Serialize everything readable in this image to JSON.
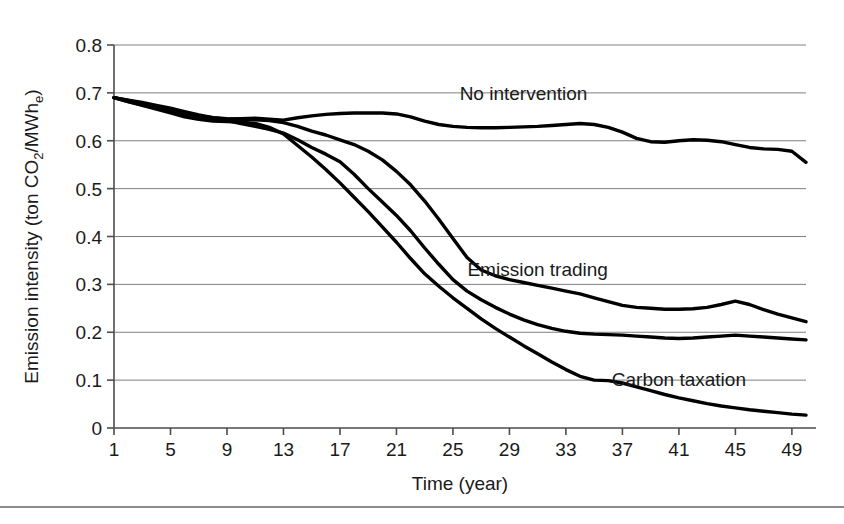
{
  "chart_data": {
    "type": "line",
    "title": "",
    "xlabel": "Time (year)",
    "ylabel": "Emission intensity (ton CO2/MWhe)",
    "ylabel_parts": {
      "prefix": "Emission intensity (ton CO",
      "sub1": "2",
      "middle": "/MWh",
      "sub2": "e",
      "suffix": ")"
    },
    "xlim": [
      1,
      50
    ],
    "ylim": [
      0,
      0.8
    ],
    "xticks": [
      1,
      5,
      9,
      13,
      17,
      21,
      25,
      29,
      33,
      37,
      41,
      45,
      49
    ],
    "yticks": [
      0,
      0.1,
      0.2,
      0.3,
      0.4,
      0.5,
      0.6,
      0.7,
      0.8
    ],
    "ytick_labels": [
      "0",
      "0.1",
      "0.2",
      "0.3",
      "0.4",
      "0.5",
      "0.6",
      "0.7",
      "0.8"
    ],
    "xtick_labels": [
      "1",
      "5",
      "9",
      "13",
      "17",
      "21",
      "25",
      "29",
      "33",
      "37",
      "41",
      "45",
      "49"
    ],
    "grid": "horizontal",
    "legend_position": "inline-annotations",
    "line_color": "#000000",
    "grid_color": "#7f7f7f",
    "axis_color": "#4d4d4d",
    "background": "#ffffff",
    "x": [
      1,
      2,
      3,
      4,
      5,
      6,
      7,
      8,
      9,
      10,
      11,
      12,
      13,
      14,
      15,
      16,
      17,
      18,
      19,
      20,
      21,
      22,
      23,
      24,
      25,
      26,
      27,
      28,
      29,
      30,
      31,
      32,
      33,
      34,
      35,
      36,
      37,
      38,
      39,
      40,
      41,
      42,
      43,
      44,
      45,
      46,
      47,
      48,
      49,
      50
    ],
    "series": [
      {
        "name": "No intervention",
        "label": "No intervention",
        "label_x": 30,
        "label_y": 0.685,
        "values": [
          0.69,
          0.685,
          0.68,
          0.674,
          0.668,
          0.661,
          0.654,
          0.648,
          0.645,
          0.646,
          0.647,
          0.645,
          0.643,
          0.648,
          0.652,
          0.655,
          0.657,
          0.658,
          0.658,
          0.658,
          0.656,
          0.65,
          0.641,
          0.634,
          0.63,
          0.628,
          0.627,
          0.627,
          0.628,
          0.629,
          0.63,
          0.632,
          0.634,
          0.636,
          0.634,
          0.628,
          0.618,
          0.605,
          0.598,
          0.597,
          0.6,
          0.602,
          0.601,
          0.598,
          0.592,
          0.586,
          0.583,
          0.582,
          0.578,
          0.555
        ]
      },
      {
        "name": "Emission trading",
        "label": "Emission trading",
        "label_x": 31,
        "label_y": 0.318,
        "values": [
          0.69,
          0.684,
          0.678,
          0.672,
          0.665,
          0.658,
          0.652,
          0.648,
          0.646,
          0.645,
          0.644,
          0.642,
          0.638,
          0.63,
          0.62,
          0.612,
          0.602,
          0.592,
          0.578,
          0.56,
          0.536,
          0.508,
          0.474,
          0.436,
          0.396,
          0.356,
          0.33,
          0.318,
          0.31,
          0.304,
          0.298,
          0.292,
          0.286,
          0.28,
          0.272,
          0.264,
          0.256,
          0.252,
          0.25,
          0.248,
          0.248,
          0.249,
          0.252,
          0.258,
          0.265,
          0.258,
          0.247,
          0.238,
          0.23,
          0.222
        ]
      },
      {
        "name": "Carbon taxation",
        "label": "Carbon taxation",
        "label_x": 41,
        "label_y": 0.088,
        "values": [
          0.69,
          0.682,
          0.675,
          0.668,
          0.66,
          0.654,
          0.648,
          0.644,
          0.642,
          0.636,
          0.63,
          0.624,
          0.616,
          0.602,
          0.586,
          0.572,
          0.556,
          0.53,
          0.5,
          0.472,
          0.444,
          0.412,
          0.376,
          0.342,
          0.31,
          0.286,
          0.268,
          0.252,
          0.238,
          0.226,
          0.216,
          0.208,
          0.202,
          0.198,
          0.196,
          0.195,
          0.194,
          0.192,
          0.19,
          0.188,
          0.187,
          0.188,
          0.19,
          0.192,
          0.194,
          0.192,
          0.19,
          0.188,
          0.186,
          0.184
        ]
      },
      {
        "name": "Carbon taxation lower branch",
        "label": "",
        "label_x": null,
        "label_y": null,
        "values": [
          0.69,
          0.682,
          0.674,
          0.666,
          0.658,
          0.65,
          0.645,
          0.641,
          0.64,
          0.639,
          0.636,
          0.628,
          0.614,
          0.59,
          0.566,
          0.54,
          0.512,
          0.482,
          0.452,
          0.42,
          0.388,
          0.354,
          0.322,
          0.296,
          0.272,
          0.25,
          0.228,
          0.208,
          0.19,
          0.172,
          0.155,
          0.138,
          0.122,
          0.108,
          0.1,
          0.099,
          0.094,
          0.086,
          0.078,
          0.07,
          0.063,
          0.057,
          0.051,
          0.046,
          0.042,
          0.038,
          0.035,
          0.032,
          0.029,
          0.027
        ]
      }
    ],
    "annotations": [
      {
        "text": "No intervention",
        "x": 30,
        "y": 0.685
      },
      {
        "text": "Emission trading",
        "x": 31,
        "y": 0.318
      },
      {
        "text": "Carbon taxation",
        "x": 41,
        "y": 0.088
      }
    ]
  },
  "figure": {
    "caption": ""
  }
}
